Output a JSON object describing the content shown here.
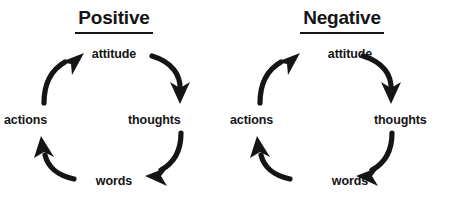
{
  "diagram": {
    "background_color": "#ffffff",
    "ink_color": "#151515",
    "panels": [
      {
        "id": "positive",
        "title": "Positive",
        "title_underlined": true,
        "direction": "clockwise",
        "nodes": [
          {
            "id": "attitude",
            "label": "attitude",
            "position": "top"
          },
          {
            "id": "thoughts",
            "label": "thoughts",
            "position": "right"
          },
          {
            "id": "words",
            "label": "words",
            "position": "bottom"
          },
          {
            "id": "actions",
            "label": "actions",
            "position": "left"
          }
        ],
        "arrows": [
          {
            "id": "attitude-to-thoughts",
            "from": "attitude",
            "to": "thoughts",
            "quadrant": "top-right",
            "points": "down-right"
          },
          {
            "id": "thoughts-to-words",
            "from": "thoughts",
            "to": "words",
            "quadrant": "bottom-right",
            "points": "down-left"
          },
          {
            "id": "words-to-actions",
            "from": "words",
            "to": "actions",
            "quadrant": "bottom-left",
            "points": "up-left"
          },
          {
            "id": "actions-to-attitude",
            "from": "actions",
            "to": "attitude",
            "quadrant": "top-left",
            "points": "up-right"
          }
        ]
      },
      {
        "id": "negative",
        "title": "Negative",
        "title_underlined": true,
        "direction": "clockwise",
        "nodes": [
          {
            "id": "attitude",
            "label": "attitude",
            "position": "top"
          },
          {
            "id": "thoughts",
            "label": "thoughts",
            "position": "right"
          },
          {
            "id": "words",
            "label": "words",
            "position": "bottom"
          },
          {
            "id": "actions",
            "label": "actions",
            "position": "left"
          }
        ],
        "arrows": [
          {
            "id": "attitude-to-thoughts",
            "from": "attitude",
            "to": "thoughts",
            "quadrant": "top-right",
            "points": "down-right"
          },
          {
            "id": "thoughts-to-words",
            "from": "thoughts",
            "to": "words",
            "quadrant": "bottom-right",
            "points": "down-left"
          },
          {
            "id": "words-to-actions",
            "from": "words",
            "to": "actions",
            "quadrant": "bottom-left",
            "points": "up-left"
          },
          {
            "id": "actions-to-attitude",
            "from": "actions",
            "to": "attitude",
            "quadrant": "top-left",
            "points": "up-right"
          }
        ]
      }
    ]
  }
}
